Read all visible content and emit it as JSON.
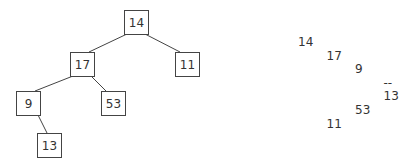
{
  "diagram": {
    "type": "binary-tree",
    "tree": {
      "nodes": [
        {
          "id": "n14",
          "label": "14"
        },
        {
          "id": "n17",
          "label": "17"
        },
        {
          "id": "n11",
          "label": "11"
        },
        {
          "id": "n9",
          "label": "9"
        },
        {
          "id": "n53",
          "label": "53"
        },
        {
          "id": "n13",
          "label": "13"
        }
      ],
      "edges": [
        {
          "from": "n14",
          "to": "n17",
          "side": "left"
        },
        {
          "from": "n14",
          "to": "n11",
          "side": "right"
        },
        {
          "from": "n17",
          "to": "n9",
          "side": "left"
        },
        {
          "from": "n17",
          "to": "n53",
          "side": "right"
        },
        {
          "from": "n9",
          "to": "n13",
          "side": "right"
        }
      ]
    },
    "sideways_listing": [
      {
        "text": "14",
        "depth": 0
      },
      {
        "text": "17",
        "depth": 1
      },
      {
        "text": "9",
        "depth": 2
      },
      {
        "text": "--",
        "depth": 3
      },
      {
        "text": "13",
        "depth": 3
      },
      {
        "text": "53",
        "depth": 2
      },
      {
        "text": "11",
        "depth": 1
      }
    ]
  }
}
